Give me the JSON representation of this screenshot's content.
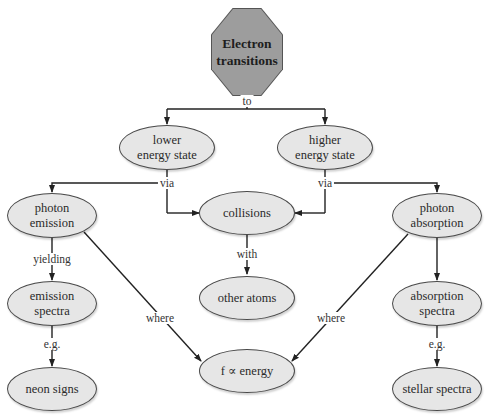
{
  "diagram": {
    "title_node": {
      "text_line1": "Electron",
      "text_line2": "transitions",
      "shape": "octagon",
      "fill": "#9d9d9d"
    },
    "nodes": {
      "lower": {
        "line1": "lower",
        "line2": "energy state"
      },
      "higher": {
        "line1": "higher",
        "line2": "energy state"
      },
      "photon_emission": {
        "line1": "photon",
        "line2": "emission"
      },
      "collisions": {
        "line1": "collisions"
      },
      "photon_absorption": {
        "line1": "photon",
        "line2": "absorption"
      },
      "other_atoms": {
        "line1": "other atoms"
      },
      "emission_spectra": {
        "line1": "emission",
        "line2": "spectra"
      },
      "absorption_spectra": {
        "line1": "absorption",
        "line2": "spectra"
      },
      "f_energy": {
        "line1": "f ∝ energy"
      },
      "neon_signs": {
        "line1": "neon signs"
      },
      "stellar_spectra": {
        "line1": "stellar spectra"
      }
    },
    "edge_labels": {
      "to": "to",
      "via_left": "via",
      "via_right": "via",
      "yielding": "yielding",
      "with": "with",
      "where_left": "where",
      "where_right": "where",
      "eg_left": "e.g.",
      "eg_right": "e.g."
    },
    "colors": {
      "node_fill": "#e6e6e6",
      "node_border": "#4a4a4a",
      "edge": "#222222",
      "octagon_fill": "#9d9d9d"
    }
  }
}
